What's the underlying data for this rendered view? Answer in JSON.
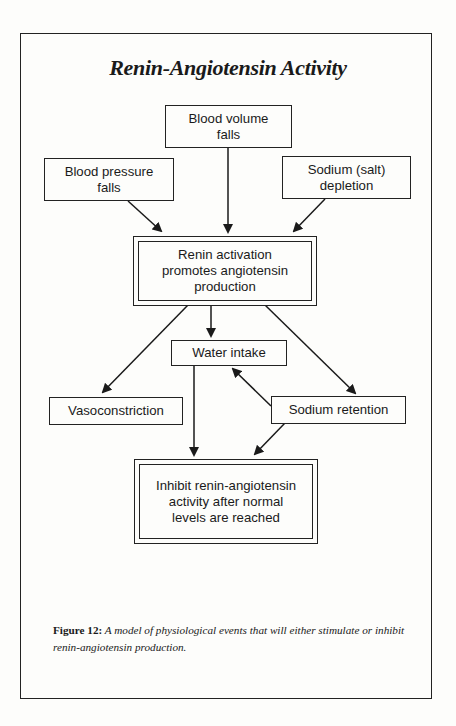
{
  "title": "Renin-Angiotensin Activity",
  "nodes": {
    "blood_volume": "Blood volume\nfalls",
    "blood_pressure": "Blood pressure\nfalls",
    "sodium_depletion": "Sodium (salt)\ndepletion",
    "renin_activation": "Renin activation\npromotes angiotensin\nproduction",
    "water_intake": "Water intake",
    "vasoconstriction": "Vasoconstriction",
    "sodium_retention": "Sodium retention",
    "inhibit": "Inhibit renin-angiotensin\nactivity after normal\nlevels are reached"
  },
  "edges": [
    {
      "from": "blood_volume",
      "to": "renin_activation"
    },
    {
      "from": "blood_pressure",
      "to": "renin_activation"
    },
    {
      "from": "sodium_depletion",
      "to": "renin_activation"
    },
    {
      "from": "renin_activation",
      "to": "water_intake"
    },
    {
      "from": "renin_activation",
      "to": "vasoconstriction"
    },
    {
      "from": "renin_activation",
      "to": "sodium_retention"
    },
    {
      "from": "sodium_retention",
      "to": "water_intake"
    },
    {
      "from": "water_intake",
      "to": "inhibit"
    },
    {
      "from": "sodium_retention",
      "to": "inhibit"
    }
  ],
  "caption": {
    "label": "Figure 12:",
    "text": " A model of physiological events that will either stimulate or inhibit renin-angiotensin production."
  }
}
